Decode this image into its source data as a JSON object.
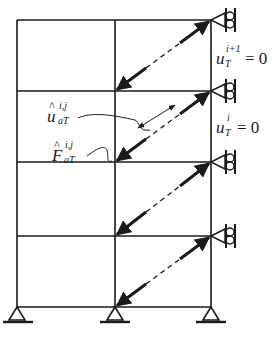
{
  "figure": {
    "type": "structural-frame-diagram",
    "stroke_color": "#1a1a1a",
    "background": "#ffffff"
  },
  "frame": {
    "columns_x": [
      17,
      115,
      211
    ],
    "floors_y": [
      20,
      91,
      162,
      236,
      307
    ],
    "bays": 2,
    "storeys": 4
  },
  "supports": {
    "base": [
      {
        "name": "pinned-support-left",
        "x": 17
      },
      {
        "name": "pinned-support-middle",
        "x": 115
      },
      {
        "name": "pinned-support-right",
        "x": 211
      }
    ],
    "roller_right": [
      {
        "name": "roller-support-floor-1",
        "y": 20
      },
      {
        "name": "roller-support-floor-2",
        "y": 91
      },
      {
        "name": "roller-support-floor-3",
        "y": 162
      },
      {
        "name": "roller-support-floor-4",
        "y": 236
      }
    ]
  },
  "labels": {
    "u_hat": {
      "base": "u",
      "hat": "^",
      "sup": "i,j",
      "sub": "aT"
    },
    "F_hat": {
      "base": "F",
      "hat": "^",
      "sup": "i,j",
      "sub": "aT"
    },
    "u_top": {
      "base": "u",
      "sup": "i+1",
      "sub": "T",
      "eq": "= 0"
    },
    "u_mid": {
      "base": "u",
      "sup": "i",
      "sub": "T",
      "eq": "= 0"
    }
  }
}
